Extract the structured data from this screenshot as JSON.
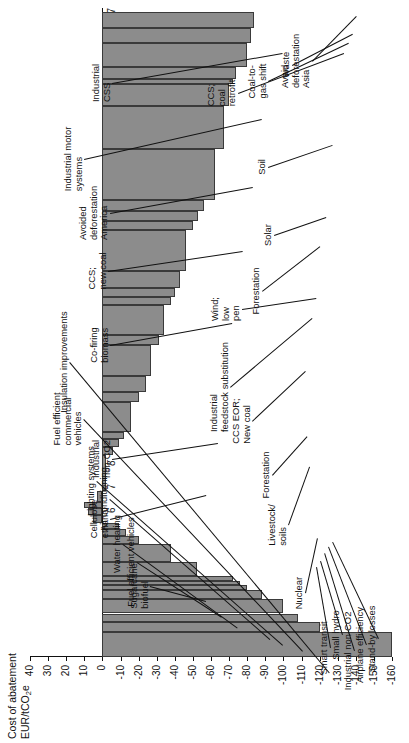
{
  "chart_data": {
    "type": "bar",
    "title": "",
    "ylabel": "Cost of abatement EUR/tCO2e",
    "ylabel_line1": "Cost of abatement",
    "ylabel_line2": "EUR/tCO",
    "ylabel_sub": "2",
    "ylabel_line2b": "e",
    "xlabel": "",
    "ylim": [
      -160,
      40
    ],
    "yticks": [
      40,
      30,
      20,
      10,
      0,
      -10,
      -20,
      -30,
      -40,
      -50,
      -60,
      -70,
      -80,
      -90,
      -100,
      -110,
      -120,
      -130,
      -140,
      -150,
      -160
    ],
    "ytick_labels": [
      "40",
      "30",
      "20",
      "10",
      "0",
      "-10",
      "-20",
      "-30",
      "-40",
      "-50",
      "-60",
      "-70",
      "-80",
      "-90",
      "-100",
      "-110",
      "-120",
      "-130",
      "-140",
      "-150",
      "-160"
    ],
    "xlim": [
      0,
      27.6
    ],
    "xticks": [
      0,
      1,
      2,
      3,
      4,
      5,
      6,
      7,
      8,
      9,
      10,
      11,
      12,
      13,
      14,
      15,
      16,
      17,
      18,
      19,
      20,
      21,
      22,
      23,
      24,
      25,
      26,
      27
    ],
    "xtick_labels": [
      "0",
      "1",
      "2",
      "3",
      "4",
      "5",
      "6",
      "7",
      "8",
      "9",
      "10",
      "11",
      "12",
      "13",
      "14",
      "15",
      "16",
      "17",
      "18",
      "19",
      "20",
      "21",
      "22",
      "23",
      "24",
      "25",
      "26",
      "27"
    ],
    "grid": false,
    "legend": "none",
    "bar_color": "#8c8c8c",
    "bar_edge": "#3a3a3a",
    "bars": [
      {
        "name": "Insulation improvements",
        "x0": 0.0,
        "x1": 1.05,
        "cost": -160
      },
      {
        "name": "Fuel efficient commercial vehicles",
        "x0": 1.05,
        "x1": 1.5,
        "cost": -120
      },
      {
        "name": "unlabelled-a",
        "x0": 1.5,
        "x1": 1.85,
        "cost": -108
      },
      {
        "name": "Lighting systems",
        "x0": 1.85,
        "x1": 2.45,
        "cost": -100
      },
      {
        "name": "unlabelled-b",
        "x0": 2.45,
        "x1": 2.85,
        "cost": -88
      },
      {
        "name": "Air conditioning",
        "x0": 2.85,
        "x1": 3.05,
        "cost": -80
      },
      {
        "name": "unlabelled-c",
        "x0": 3.05,
        "x1": 3.25,
        "cost": -76
      },
      {
        "name": "unlabelled-d",
        "x0": 3.25,
        "x1": 3.45,
        "cost": -72
      },
      {
        "name": "Water heating",
        "x0": 3.45,
        "x1": 4.05,
        "cost": -52
      },
      {
        "name": "Fuel efficient vehicles",
        "x0": 4.05,
        "x1": 4.8,
        "cost": -38
      },
      {
        "name": "Sugarcane biofuel",
        "x0": 4.8,
        "x1": 5.15,
        "cost": -20
      },
      {
        "name": "Stand-by losses",
        "x0": 5.15,
        "x1": 5.45,
        "cost": -13
      },
      {
        "name": "Airplane efficiency",
        "x0": 5.45,
        "x1": 5.7,
        "cost": -9
      },
      {
        "name": "Industrial non-CO2",
        "x0": 5.7,
        "x1": 6.05,
        "cost": 5
      },
      {
        "name": "Small hydro",
        "x0": 6.05,
        "x1": 6.35,
        "cost": 8
      },
      {
        "name": "Smart transit",
        "x0": 6.35,
        "x1": 6.6,
        "cost": 10
      },
      {
        "name": "Nuclear",
        "x0": 6.6,
        "x1": 7.05,
        "cost": 3
      },
      {
        "name": "Cellulose ethanol",
        "x0": 7.05,
        "x1": 8.6,
        "cost": -2
      },
      {
        "name": "Livestock/soils",
        "x0": 8.6,
        "x1": 8.95,
        "cost": -6
      },
      {
        "name": "Forestation-1",
        "x0": 8.95,
        "x1": 9.25,
        "cost": -9
      },
      {
        "name": "Forestation-2",
        "x0": 9.25,
        "x1": 9.55,
        "cost": -12
      },
      {
        "name": "Industrial non-CO2 (b)",
        "x0": 9.55,
        "x1": 10.85,
        "cost": -16
      },
      {
        "name": "Forestation-3",
        "x0": 10.85,
        "x1": 11.25,
        "cost": -20
      },
      {
        "name": "CCS EOR; New coal",
        "x0": 11.25,
        "x1": 11.95,
        "cost": -24
      },
      {
        "name": "Industrial feedstock substitution",
        "x0": 11.95,
        "x1": 13.25,
        "cost": -27
      },
      {
        "name": "Wind; low pen",
        "x0": 13.25,
        "x1": 13.7,
        "cost": -31
      },
      {
        "name": "Co-firing biomass",
        "x0": 13.7,
        "x1": 14.95,
        "cost": -34
      },
      {
        "name": "Forestation-4",
        "x0": 14.95,
        "x1": 15.3,
        "cost": -38
      },
      {
        "name": "Forestation-5",
        "x0": 15.3,
        "x1": 15.7,
        "cost": -40
      },
      {
        "name": "Solar",
        "x0": 15.7,
        "x1": 16.4,
        "cost": -43
      },
      {
        "name": "CCS; new coal",
        "x0": 16.4,
        "x1": 18.15,
        "cost": -46
      },
      {
        "name": "unlabelled-e",
        "x0": 18.15,
        "x1": 18.55,
        "cost": -50
      },
      {
        "name": "unlabelled-f",
        "x0": 18.55,
        "x1": 18.95,
        "cost": -53
      },
      {
        "name": "Soil",
        "x0": 18.95,
        "x1": 19.45,
        "cost": -56
      },
      {
        "name": "Avoided deforestation America",
        "x0": 19.45,
        "x1": 21.6,
        "cost": -62
      },
      {
        "name": "Industrial motor systems",
        "x0": 21.6,
        "x1": 23.45,
        "cost": -67
      },
      {
        "name": "CCS; coal retrofit",
        "x0": 23.45,
        "x1": 24.35,
        "cost": -70
      },
      {
        "name": "Coal-to-gas shift",
        "x0": 24.35,
        "x1": 24.6,
        "cost": -72
      },
      {
        "name": "Waste",
        "x0": 24.6,
        "x1": 25.1,
        "cost": -74
      },
      {
        "name": "Industrial CSS",
        "x0": 25.1,
        "x1": 26.1,
        "cost": -80
      },
      {
        "name": "unlabelled-g",
        "x0": 26.1,
        "x1": 26.75,
        "cost": -82
      },
      {
        "name": "Avoid deforestation Asia",
        "x0": 26.75,
        "x1": 27.45,
        "cost": -84
      }
    ],
    "annotations": [
      {
        "id": "smart-transit",
        "text": "Smart transit"
      },
      {
        "id": "small-hydro",
        "text": "Small hydro"
      },
      {
        "id": "industrial-non-co2",
        "text": "Industrial non-CO2"
      },
      {
        "id": "airplane-efficiency",
        "text": "Airplane efficiency"
      },
      {
        "id": "standby-losses",
        "text": "Stand-by losses"
      },
      {
        "id": "nuclear",
        "text": "Nuclear"
      },
      {
        "id": "livestock-soils",
        "text": "Livestock/\nsoils"
      },
      {
        "id": "forestation-low",
        "text": "Forestation"
      },
      {
        "id": "ccs-eor-new-coal",
        "text": "CCS EOR;\nNew coal"
      },
      {
        "id": "industrial-feedstock",
        "text": "Industrial\nfeedstock substitution"
      },
      {
        "id": "wind-low-pen",
        "text": "Wind;\nlow\npen"
      },
      {
        "id": "forestation-mid",
        "text": "Forestation"
      },
      {
        "id": "solar",
        "text": "Solar"
      },
      {
        "id": "soil",
        "text": "Soil"
      },
      {
        "id": "ccs-coal-retrofit",
        "text": "CCS;\ncoal\nretrofit"
      },
      {
        "id": "coal-to-gas-shift",
        "text": "Coal-to-\ngas shift"
      },
      {
        "id": "waste",
        "text": "Waste"
      },
      {
        "id": "avoid-deforestation-asia",
        "text": "Avoid\ndeforestation\nAsia"
      },
      {
        "id": "sugarcane-biofuel",
        "text": "Sugarcane\nbiofuel"
      },
      {
        "id": "fuel-efficient-vehicles",
        "text": "Fuel efficient vehicles"
      },
      {
        "id": "water-heating",
        "text": "Water heating"
      },
      {
        "id": "air-conditioning",
        "text": "Air conditioning"
      },
      {
        "id": "lighting-systems",
        "text": "Lighting systems"
      },
      {
        "id": "fuel-efficient-commercial-vehicles",
        "text": "Fuel efficient\ncommercial\nvehicles"
      },
      {
        "id": "insulation-improvements",
        "text": "Insulation improvements"
      },
      {
        "id": "cellulose-ethanol",
        "text": "Cellulose\nethanol"
      },
      {
        "id": "industrial-non-co2-b",
        "text": "Industrial\nnon-CO2"
      },
      {
        "id": "co-firing-biomass",
        "text": "Co-firing\nbiomass"
      },
      {
        "id": "ccs-new-coal",
        "text": "CCS;\nnew coal"
      },
      {
        "id": "avoided-deforestation-america",
        "text": "Avoided\ndeforestation\nAmerica"
      },
      {
        "id": "industrial-motor-systems",
        "text": "Industrial motor\nsystems"
      },
      {
        "id": "industrial-css",
        "text": "Industrial\nCSS"
      }
    ]
  }
}
